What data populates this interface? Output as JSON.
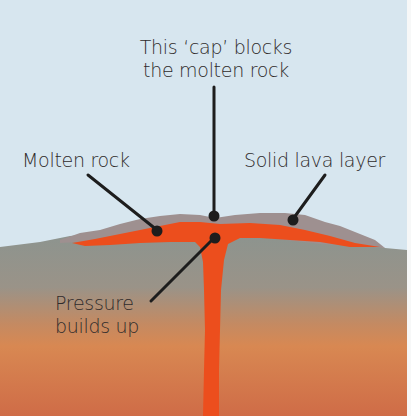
{
  "diagram": {
    "labels": {
      "cap": [
        "This ‘cap’ blocks",
        "the molten rock"
      ],
      "molten_rock": "Molten rock",
      "solid_lava": "Solid lava layer",
      "pressure": [
        "Pressure",
        "builds up"
      ]
    },
    "colors": {
      "sky": "#d7e6ef",
      "solid_lava": "#9c8f8f",
      "molten": "#ec4e1d",
      "ground_top": "#8d9590",
      "ground_mid": "#c98a5e",
      "ground_bottom": "#d6724a",
      "leader_line": "#1d1d1d",
      "text": "#2f2b2b"
    }
  }
}
